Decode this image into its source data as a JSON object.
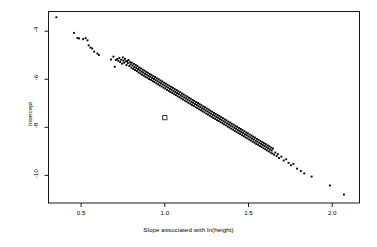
{
  "chart_data": {
    "type": "scatter",
    "title": "",
    "xlabel": "Slope associated with ln(height)",
    "ylabel": "Intercept",
    "xlim": [
      0.305,
      2.163
    ],
    "ylim": [
      -11.15,
      -3.18
    ],
    "grid": false,
    "legend": null,
    "xticks": [
      0.5,
      1.0,
      1.5,
      2.0
    ],
    "xtick_labels": [
      "0.5",
      "1.0",
      "1.5",
      "2.0"
    ],
    "yticks": [
      -4,
      -6,
      -8,
      -10
    ],
    "ytick_labels": [
      "-4",
      "-6",
      "-8",
      "-10"
    ],
    "series": [
      {
        "name": "fitted regressions",
        "marker": "filled-square",
        "color": "#000000",
        "size": 1.9,
        "points": [
          [
            0.352,
            -3.42
          ],
          [
            0.457,
            -4.07
          ],
          [
            0.478,
            -4.28
          ],
          [
            0.487,
            -4.3
          ],
          [
            0.512,
            -4.33
          ],
          [
            0.527,
            -4.29
          ],
          [
            0.538,
            -4.38
          ],
          [
            0.545,
            -4.59
          ],
          [
            0.556,
            -4.68
          ],
          [
            0.566,
            -4.72
          ],
          [
            0.578,
            -4.85
          ],
          [
            0.597,
            -4.93
          ],
          [
            0.606,
            -4.99
          ],
          [
            0.679,
            -5.18
          ],
          [
            0.693,
            -5.06
          ],
          [
            0.701,
            -5.48
          ],
          [
            0.707,
            -5.2
          ],
          [
            0.715,
            -5.16
          ],
          [
            0.722,
            -5.23
          ],
          [
            0.728,
            -5.12
          ],
          [
            0.733,
            -5.28
          ],
          [
            0.739,
            -5.19
          ],
          [
            0.745,
            -5.35
          ],
          [
            0.749,
            -5.09
          ],
          [
            0.752,
            -5.22
          ],
          [
            0.757,
            -5.31
          ],
          [
            0.762,
            -5.15
          ],
          [
            0.766,
            -5.26
          ],
          [
            0.771,
            -5.41
          ],
          [
            0.775,
            -5.24
          ],
          [
            0.779,
            -5.33
          ],
          [
            0.783,
            -5.2
          ],
          [
            0.788,
            -5.45
          ],
          [
            0.792,
            -5.29
          ],
          [
            0.796,
            -5.38
          ],
          [
            0.8,
            -5.52
          ],
          [
            0.803,
            -5.31
          ],
          [
            0.807,
            -5.43
          ],
          [
            0.811,
            -5.57
          ],
          [
            0.815,
            -5.36
          ],
          [
            0.818,
            -5.49
          ],
          [
            0.822,
            -5.62
          ],
          [
            0.826,
            -5.41
          ],
          [
            0.829,
            -5.53
          ],
          [
            0.833,
            -5.66
          ],
          [
            0.836,
            -5.45
          ],
          [
            0.84,
            -5.58
          ],
          [
            0.843,
            -5.72
          ],
          [
            0.847,
            -5.51
          ],
          [
            0.85,
            -5.63
          ],
          [
            0.854,
            -5.76
          ],
          [
            0.857,
            -5.55
          ],
          [
            0.861,
            -5.68
          ],
          [
            0.864,
            -5.81
          ],
          [
            0.868,
            -5.6
          ],
          [
            0.871,
            -5.72
          ],
          [
            0.875,
            -5.85
          ],
          [
            0.878,
            -5.64
          ],
          [
            0.882,
            -5.77
          ],
          [
            0.885,
            -5.9
          ],
          [
            0.889,
            -5.69
          ],
          [
            0.892,
            -5.81
          ],
          [
            0.896,
            -5.94
          ],
          [
            0.899,
            -5.73
          ],
          [
            0.903,
            -5.86
          ],
          [
            0.906,
            -5.99
          ],
          [
            0.91,
            -5.78
          ],
          [
            0.913,
            -5.9
          ],
          [
            0.917,
            -6.03
          ],
          [
            0.92,
            -5.82
          ],
          [
            0.924,
            -5.95
          ],
          [
            0.928,
            -6.08
          ],
          [
            0.931,
            -5.87
          ],
          [
            0.935,
            -5.99
          ],
          [
            0.938,
            -6.12
          ],
          [
            0.942,
            -5.91
          ],
          [
            0.945,
            -6.04
          ],
          [
            0.949,
            -6.17
          ],
          [
            0.952,
            -5.96
          ],
          [
            0.956,
            -6.08
          ],
          [
            0.96,
            -6.21
          ],
          [
            0.963,
            -6.0
          ],
          [
            0.967,
            -6.13
          ],
          [
            0.97,
            -6.26
          ],
          [
            0.974,
            -6.05
          ],
          [
            0.977,
            -6.17
          ],
          [
            0.981,
            -6.3
          ],
          [
            0.984,
            -6.09
          ],
          [
            0.988,
            -6.22
          ],
          [
            0.992,
            -6.35
          ],
          [
            0.995,
            -6.14
          ],
          [
            0.999,
            -6.26
          ],
          [
            1.002,
            -6.39
          ],
          [
            1.006,
            -6.18
          ],
          [
            1.009,
            -6.31
          ],
          [
            1.013,
            -6.44
          ],
          [
            1.016,
            -6.23
          ],
          [
            1.02,
            -6.35
          ],
          [
            1.024,
            -6.48
          ],
          [
            1.027,
            -6.27
          ],
          [
            1.031,
            -6.4
          ],
          [
            1.034,
            -6.53
          ],
          [
            1.038,
            -6.32
          ],
          [
            1.041,
            -6.44
          ],
          [
            1.045,
            -6.57
          ],
          [
            1.048,
            -6.36
          ],
          [
            1.052,
            -6.49
          ],
          [
            1.056,
            -6.62
          ],
          [
            1.059,
            -6.41
          ],
          [
            1.063,
            -6.53
          ],
          [
            1.066,
            -6.66
          ],
          [
            1.07,
            -6.45
          ],
          [
            1.073,
            -6.58
          ],
          [
            1.077,
            -6.71
          ],
          [
            1.08,
            -6.5
          ],
          [
            1.084,
            -6.62
          ],
          [
            1.088,
            -6.75
          ],
          [
            1.091,
            -6.54
          ],
          [
            1.095,
            -6.67
          ],
          [
            1.098,
            -6.8
          ],
          [
            1.102,
            -6.59
          ],
          [
            1.105,
            -6.71
          ],
          [
            1.109,
            -6.84
          ],
          [
            1.112,
            -6.63
          ],
          [
            1.116,
            -6.76
          ],
          [
            1.12,
            -6.89
          ],
          [
            1.123,
            -6.68
          ],
          [
            1.127,
            -6.8
          ],
          [
            1.13,
            -6.93
          ],
          [
            1.134,
            -6.72
          ],
          [
            1.137,
            -6.85
          ],
          [
            1.141,
            -6.98
          ],
          [
            1.144,
            -6.77
          ],
          [
            1.148,
            -6.89
          ],
          [
            1.152,
            -7.02
          ],
          [
            1.155,
            -6.81
          ],
          [
            1.159,
            -6.94
          ],
          [
            1.162,
            -7.07
          ],
          [
            1.166,
            -6.86
          ],
          [
            1.169,
            -6.98
          ],
          [
            1.173,
            -7.11
          ],
          [
            1.176,
            -6.9
          ],
          [
            1.18,
            -7.03
          ],
          [
            1.184,
            -7.16
          ],
          [
            1.187,
            -6.95
          ],
          [
            1.191,
            -7.07
          ],
          [
            1.194,
            -7.2
          ],
          [
            1.198,
            -6.99
          ],
          [
            1.201,
            -7.12
          ],
          [
            1.205,
            -7.25
          ],
          [
            1.208,
            -7.04
          ],
          [
            1.212,
            -7.16
          ],
          [
            1.216,
            -7.29
          ],
          [
            1.219,
            -7.08
          ],
          [
            1.223,
            -7.21
          ],
          [
            1.226,
            -7.34
          ],
          [
            1.23,
            -7.13
          ],
          [
            1.233,
            -7.25
          ],
          [
            1.237,
            -7.38
          ],
          [
            1.24,
            -7.17
          ],
          [
            1.244,
            -7.3
          ],
          [
            1.248,
            -7.43
          ],
          [
            1.251,
            -7.22
          ],
          [
            1.255,
            -7.34
          ],
          [
            1.258,
            -7.47
          ],
          [
            1.262,
            -7.26
          ],
          [
            1.265,
            -7.39
          ],
          [
            1.269,
            -7.52
          ],
          [
            1.272,
            -7.31
          ],
          [
            1.276,
            -7.43
          ],
          [
            1.28,
            -7.56
          ],
          [
            1.283,
            -7.35
          ],
          [
            1.287,
            -7.48
          ],
          [
            1.29,
            -7.61
          ],
          [
            1.294,
            -7.4
          ],
          [
            1.297,
            -7.52
          ],
          [
            1.301,
            -7.65
          ],
          [
            1.304,
            -7.44
          ],
          [
            1.308,
            -7.57
          ],
          [
            1.312,
            -7.7
          ],
          [
            1.315,
            -7.49
          ],
          [
            1.319,
            -7.61
          ],
          [
            1.322,
            -7.74
          ],
          [
            1.326,
            -7.53
          ],
          [
            1.329,
            -7.66
          ],
          [
            1.333,
            -7.79
          ],
          [
            1.336,
            -7.58
          ],
          [
            1.34,
            -7.7
          ],
          [
            1.344,
            -7.83
          ],
          [
            1.347,
            -7.62
          ],
          [
            1.351,
            -7.75
          ],
          [
            1.354,
            -7.88
          ],
          [
            1.358,
            -7.67
          ],
          [
            1.361,
            -7.79
          ],
          [
            1.365,
            -7.92
          ],
          [
            1.368,
            -7.71
          ],
          [
            1.372,
            -7.84
          ],
          [
            1.376,
            -7.97
          ],
          [
            1.379,
            -7.76
          ],
          [
            1.383,
            -7.88
          ],
          [
            1.386,
            -8.01
          ],
          [
            1.39,
            -7.8
          ],
          [
            1.393,
            -7.93
          ],
          [
            1.397,
            -8.06
          ],
          [
            1.4,
            -7.85
          ],
          [
            1.404,
            -7.97
          ],
          [
            1.408,
            -8.1
          ],
          [
            1.411,
            -7.89
          ],
          [
            1.415,
            -8.02
          ],
          [
            1.418,
            -8.15
          ],
          [
            1.422,
            -7.94
          ],
          [
            1.425,
            -8.06
          ],
          [
            1.429,
            -8.19
          ],
          [
            1.432,
            -7.98
          ],
          [
            1.436,
            -8.11
          ],
          [
            1.44,
            -8.24
          ],
          [
            1.443,
            -8.03
          ],
          [
            1.447,
            -8.15
          ],
          [
            1.45,
            -8.28
          ],
          [
            1.454,
            -8.07
          ],
          [
            1.457,
            -8.2
          ],
          [
            1.461,
            -8.33
          ],
          [
            1.464,
            -8.12
          ],
          [
            1.468,
            -8.24
          ],
          [
            1.472,
            -8.37
          ],
          [
            1.475,
            -8.16
          ],
          [
            1.479,
            -8.29
          ],
          [
            1.482,
            -8.42
          ],
          [
            1.486,
            -8.21
          ],
          [
            1.489,
            -8.33
          ],
          [
            1.493,
            -8.46
          ],
          [
            1.496,
            -8.25
          ],
          [
            1.5,
            -8.38
          ],
          [
            1.504,
            -8.51
          ],
          [
            1.507,
            -8.3
          ],
          [
            1.511,
            -8.42
          ],
          [
            1.514,
            -8.55
          ],
          [
            1.518,
            -8.34
          ],
          [
            1.521,
            -8.47
          ],
          [
            1.525,
            -8.6
          ],
          [
            1.528,
            -8.39
          ],
          [
            1.532,
            -8.51
          ],
          [
            1.536,
            -8.64
          ],
          [
            1.539,
            -8.43
          ],
          [
            1.543,
            -8.56
          ],
          [
            1.546,
            -8.69
          ],
          [
            1.55,
            -8.48
          ],
          [
            1.553,
            -8.6
          ],
          [
            1.557,
            -8.73
          ],
          [
            1.56,
            -8.52
          ],
          [
            1.564,
            -8.65
          ],
          [
            1.568,
            -8.78
          ],
          [
            1.571,
            -8.57
          ],
          [
            1.575,
            -8.69
          ],
          [
            1.578,
            -8.82
          ],
          [
            1.582,
            -8.61
          ],
          [
            1.585,
            -8.74
          ],
          [
            1.589,
            -8.87
          ],
          [
            1.592,
            -8.66
          ],
          [
            1.596,
            -8.78
          ],
          [
            1.6,
            -8.91
          ],
          [
            1.603,
            -8.7
          ],
          [
            1.607,
            -8.83
          ],
          [
            1.61,
            -8.96
          ],
          [
            1.614,
            -8.75
          ],
          [
            1.617,
            -8.87
          ],
          [
            1.621,
            -9.0
          ],
          [
            1.624,
            -8.79
          ],
          [
            1.628,
            -8.92
          ],
          [
            1.632,
            -9.05
          ],
          [
            1.635,
            -8.84
          ],
          [
            1.639,
            -8.96
          ],
          [
            1.642,
            -9.09
          ],
          [
            1.646,
            -8.88
          ],
          [
            1.653,
            -9.14
          ],
          [
            1.66,
            -9.05
          ],
          [
            1.668,
            -9.2
          ],
          [
            1.675,
            -9.12
          ],
          [
            1.682,
            -9.28
          ],
          [
            1.696,
            -9.22
          ],
          [
            1.71,
            -9.38
          ],
          [
            1.725,
            -9.33
          ],
          [
            1.739,
            -9.48
          ],
          [
            1.753,
            -9.58
          ],
          [
            1.768,
            -9.52
          ],
          [
            1.79,
            -9.72
          ],
          [
            1.812,
            -9.82
          ],
          [
            1.833,
            -9.92
          ],
          [
            1.877,
            -10.05
          ],
          [
            1.986,
            -10.42
          ],
          [
            2.07,
            -10.8
          ]
        ]
      },
      {
        "name": "highlighted reference",
        "marker": "open-square",
        "color": "#000000",
        "size": 4.2,
        "points": [
          [
            1.0,
            -7.6
          ]
        ]
      }
    ]
  },
  "figure": {
    "background": "#ffffff",
    "frame_color": "#000000",
    "point_color": "#000000"
  }
}
